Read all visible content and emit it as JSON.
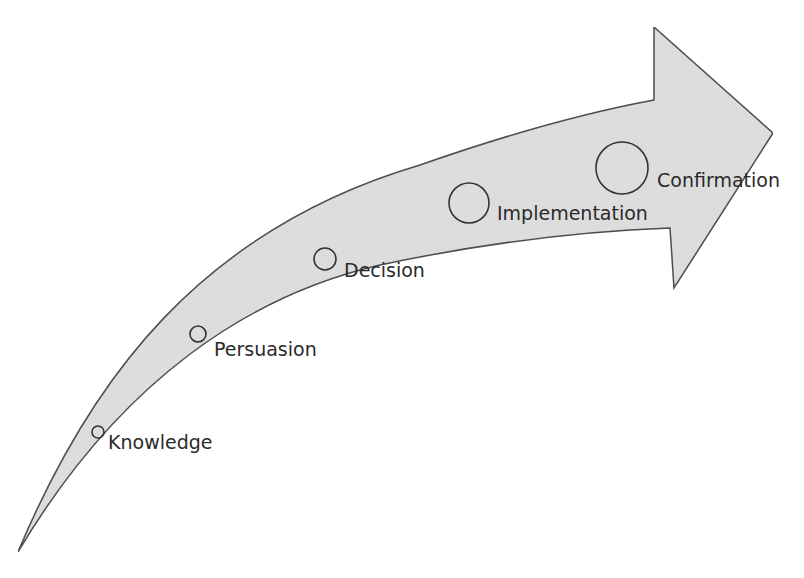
{
  "diagram": {
    "type": "curved-arrow-process",
    "colors": {
      "arrow_fill": "#dcdcdc",
      "arrow_stroke": "#333333",
      "text": "#2a2a2a",
      "background": "#ffffff"
    },
    "stages": [
      {
        "label": "Knowledge",
        "order": 1
      },
      {
        "label": "Persuasion",
        "order": 2
      },
      {
        "label": "Decision",
        "order": 3
      },
      {
        "label": "Implementation",
        "order": 4
      },
      {
        "label": "Confirmation",
        "order": 5
      }
    ]
  }
}
